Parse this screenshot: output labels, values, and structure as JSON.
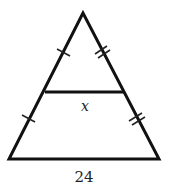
{
  "diagram": {
    "type": "triangle-midsegment",
    "midsegment_label": "x",
    "base_label": "24",
    "left_side_tick_count": 1,
    "right_side_tick_count": 2,
    "stroke_color": "#111111"
  }
}
